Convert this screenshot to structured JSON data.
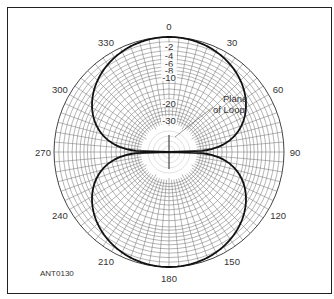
{
  "chart_data": {
    "type": "polar",
    "title": "",
    "figure_id": "ANT0130",
    "annotation": "Plane of Loop",
    "annotation_lines": [
      "Plane",
      "of Loop"
    ],
    "angle_ticks": [
      0,
      30,
      60,
      90,
      120,
      150,
      180,
      210,
      240,
      270,
      300,
      330
    ],
    "angle_labels": [
      "0",
      "30",
      "60",
      "90",
      "120",
      "150",
      "180",
      "210",
      "240",
      "270",
      "300",
      "330"
    ],
    "radial_scale": "ARRL log-periodic (dB)",
    "radial_ticks": [
      0,
      -2,
      -4,
      -6,
      -8,
      -10,
      -20,
      -30
    ],
    "radial_labels": [
      "-2",
      "-4",
      "-6",
      "-8",
      "-10",
      "-20",
      "-30"
    ],
    "grid": true,
    "series": [
      {
        "name": "Loop antenna pattern",
        "shape": "figure-eight (cos θ)",
        "angles_deg": [
          0,
          15,
          30,
          45,
          60,
          75,
          80,
          85,
          90,
          95,
          100,
          105,
          120,
          135,
          150,
          165,
          180,
          195,
          210,
          225,
          240,
          255,
          260,
          265,
          270,
          275,
          280,
          285,
          300,
          315,
          330,
          345
        ],
        "gain_db": [
          0,
          -0.3,
          -1.25,
          -3.0,
          -6.0,
          -11.7,
          -15.2,
          -21.2,
          -40,
          -21.2,
          -15.2,
          -11.7,
          -6.0,
          -3.0,
          -1.25,
          -0.3,
          0,
          -0.3,
          -1.25,
          -3.0,
          -6.0,
          -11.7,
          -15.2,
          -21.2,
          -40,
          -21.2,
          -15.2,
          -11.7,
          -6.0,
          -3.0,
          -1.25,
          -0.3
        ]
      }
    ]
  }
}
